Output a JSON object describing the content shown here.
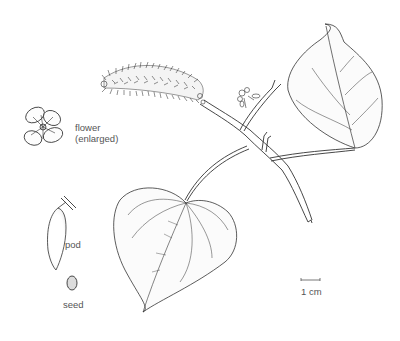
{
  "illustration": {
    "subject": "botanical illustration",
    "labels": {
      "flower_line1": "flower",
      "flower_line2": "(enlarged)",
      "pod": "pod",
      "seed": "seed",
      "scale": "1 cm"
    },
    "colors": {
      "background": "#ffffff",
      "ink": "#2a2a2a",
      "label_text": "#555555"
    }
  }
}
